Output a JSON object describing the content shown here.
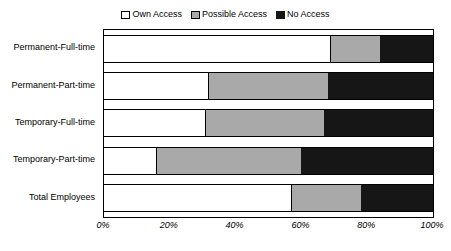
{
  "chart_data": {
    "type": "bar",
    "orientation": "horizontal",
    "stacked": true,
    "title": "",
    "xlabel": "",
    "ylabel": "",
    "xlim": [
      0,
      100
    ],
    "grid": false,
    "legend_position": "top-center",
    "categories": [
      "Permanent-Full-time",
      "Permanent-Part-time",
      "Temporary-Full-time",
      "Temporary-Part-time",
      "Total Employees"
    ],
    "xticks": [
      "0%",
      "20%",
      "40%",
      "60%",
      "80%",
      "100%"
    ],
    "xtick_values": [
      0,
      20,
      40,
      60,
      80,
      100
    ],
    "series": [
      {
        "name": "Own Access",
        "color": "#ffffff",
        "values": [
          69,
          32,
          31,
          16,
          57
        ]
      },
      {
        "name": "Possible Access",
        "color": "#a9a9a9",
        "values": [
          15,
          36,
          36,
          44,
          21
        ]
      },
      {
        "name": "No Access",
        "color": "#161616",
        "values": [
          16,
          32,
          33,
          40,
          22
        ]
      }
    ]
  },
  "legend": {
    "items": [
      {
        "label": "Own Access",
        "swatch": "own-access-swatch"
      },
      {
        "label": "Possible Access",
        "swatch": "possible-access-swatch"
      },
      {
        "label": "No Access",
        "swatch": "no-access-swatch"
      }
    ]
  }
}
